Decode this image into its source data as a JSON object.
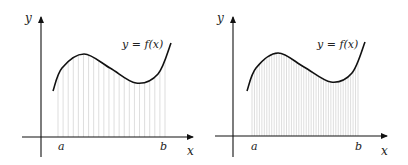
{
  "figures": [
    {
      "id": "left",
      "caption_label": "y = f(x)",
      "axis_labels": {
        "x": "x",
        "y": "y"
      },
      "interval_labels": {
        "a": "a",
        "b": "b"
      },
      "n_lines": 22,
      "geometry": {
        "origin": [
          41,
          137
        ],
        "x_axis": [
          22,
          193
        ],
        "y_axis": [
          17,
          157
        ],
        "curve": [
          [
            53,
            91
          ],
          [
            62,
            68
          ],
          [
            84,
            54
          ],
          [
            110,
            68
          ],
          [
            136,
            83
          ],
          [
            158,
            74
          ],
          [
            171,
            43
          ]
        ],
        "lines_from": 58,
        "lines_to": 165,
        "label_pos": [
          122,
          48
        ],
        "ylabel_pos": [
          25,
          22
        ],
        "xlabel_pos": [
          187,
          155
        ],
        "a_pos": [
          58,
          150
        ],
        "b_pos": [
          160,
          150
        ]
      }
    },
    {
      "id": "right",
      "caption_label": "y = f(x)",
      "axis_labels": {
        "x": "x",
        "y": "y"
      },
      "interval_labels": {
        "a": "a",
        "b": "b"
      },
      "n_lines": 44,
      "geometry": {
        "origin": [
          233,
          136
        ],
        "x_axis": [
          215,
          387
        ],
        "y_axis": [
          17,
          157
        ],
        "curve": [
          [
            247,
            91
          ],
          [
            256,
            68
          ],
          [
            278,
            53
          ],
          [
            304,
            67
          ],
          [
            331,
            82
          ],
          [
            352,
            73
          ],
          [
            365,
            42
          ]
        ],
        "lines_from": 252,
        "lines_to": 358,
        "label_pos": [
          317,
          48
        ],
        "ylabel_pos": [
          217,
          22
        ],
        "xlabel_pos": [
          381,
          155
        ],
        "a_pos": [
          251,
          150
        ],
        "b_pos": [
          355,
          150
        ]
      }
    }
  ],
  "colors": {
    "axis": "#111111",
    "curve": "#111111",
    "lines": "#c8c8c8",
    "background": "#ffffff"
  }
}
